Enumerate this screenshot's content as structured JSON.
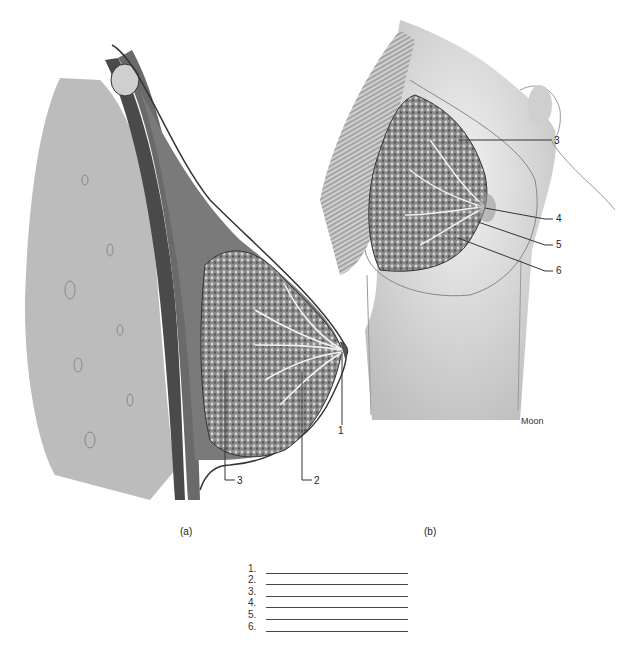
{
  "figure_a": {
    "caption": "(a)",
    "labels": [
      {
        "id": "1",
        "text": "1"
      },
      {
        "id": "2",
        "text": "2"
      },
      {
        "id": "3",
        "text": "3"
      }
    ]
  },
  "figure_b": {
    "caption": "(b)",
    "artist_signature": "Moon",
    "labels": [
      {
        "id": "3",
        "text": "3"
      },
      {
        "id": "4",
        "text": "4"
      },
      {
        "id": "5",
        "text": "5"
      },
      {
        "id": "6",
        "text": "6"
      }
    ]
  },
  "answer_key": {
    "items": [
      {
        "number": "1.",
        "value": ""
      },
      {
        "number": "2.",
        "value": ""
      },
      {
        "number": "3.",
        "value": ""
      },
      {
        "number": "4.",
        "value": ""
      },
      {
        "number": "5.",
        "value": ""
      },
      {
        "number": "6.",
        "value": ""
      }
    ]
  },
  "colors": {
    "line": "#333333",
    "tissue_light": "#c9c9c9",
    "tissue_dark": "#3a3a3a",
    "background": "#ffffff"
  }
}
